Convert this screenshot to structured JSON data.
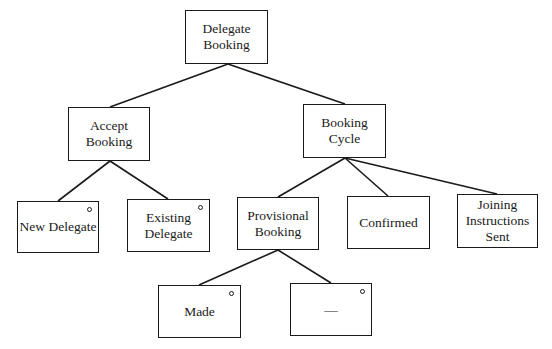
{
  "diagram": {
    "type": "structure-chart",
    "nodes": [
      {
        "id": "root",
        "label": "Delegate\nBooking",
        "selection": false
      },
      {
        "id": "accept",
        "label": "Accept\nBooking",
        "selection": false
      },
      {
        "id": "cycle",
        "label": "Booking\nCycle",
        "selection": false
      },
      {
        "id": "new",
        "label": "New Delegate",
        "selection": true
      },
      {
        "id": "existing",
        "label": "Existing\nDelegate",
        "selection": true
      },
      {
        "id": "provisional",
        "label": "Provisional\nBooking",
        "selection": false
      },
      {
        "id": "confirmed",
        "label": "Confirmed",
        "selection": false
      },
      {
        "id": "joining",
        "label": "Joining\nInstructions\nSent",
        "selection": false
      },
      {
        "id": "made",
        "label": "Made",
        "selection": true
      },
      {
        "id": "dash",
        "label": "—",
        "selection": true
      }
    ],
    "edges": [
      {
        "from": "root",
        "to": "accept"
      },
      {
        "from": "root",
        "to": "cycle"
      },
      {
        "from": "accept",
        "to": "new"
      },
      {
        "from": "accept",
        "to": "existing"
      },
      {
        "from": "cycle",
        "to": "provisional"
      },
      {
        "from": "cycle",
        "to": "confirmed"
      },
      {
        "from": "cycle",
        "to": "joining"
      },
      {
        "from": "provisional",
        "to": "made"
      },
      {
        "from": "provisional",
        "to": "dash"
      }
    ],
    "selection_marker": "small-circle"
  }
}
